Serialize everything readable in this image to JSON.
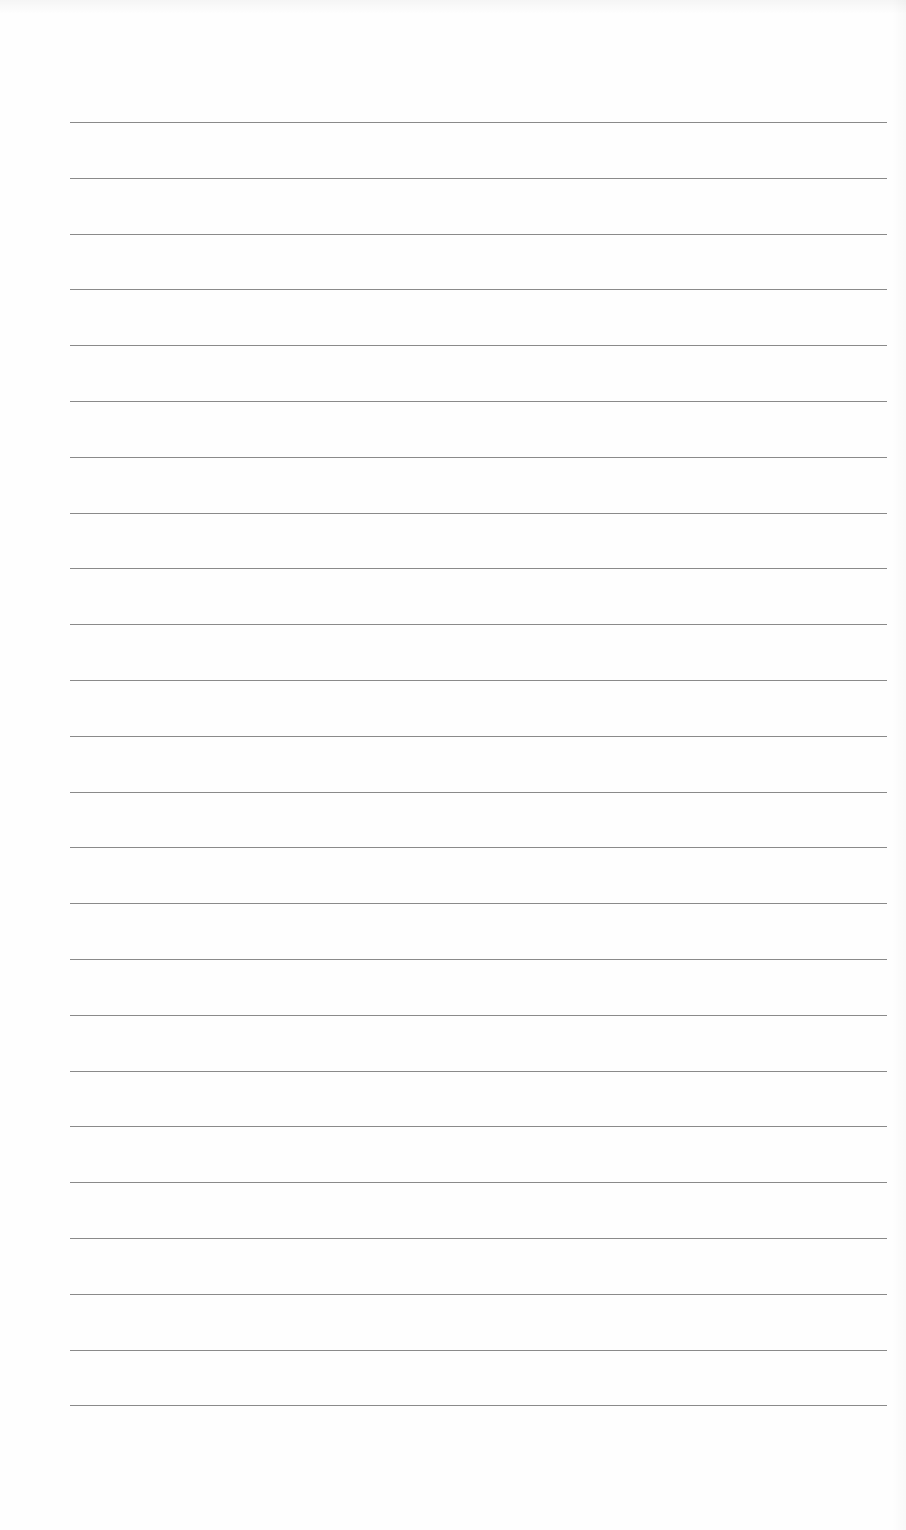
{
  "document": {
    "type": "lined-paper",
    "background_color": "#fefefe",
    "line_color": "#8a8a8a",
    "line_count": 24,
    "line_left": 70,
    "line_right": 887,
    "first_line_y": 122,
    "line_spacing": 55.8,
    "lines": [
      {
        "index": 1,
        "text": ""
      },
      {
        "index": 2,
        "text": ""
      },
      {
        "index": 3,
        "text": ""
      },
      {
        "index": 4,
        "text": ""
      },
      {
        "index": 5,
        "text": ""
      },
      {
        "index": 6,
        "text": ""
      },
      {
        "index": 7,
        "text": ""
      },
      {
        "index": 8,
        "text": ""
      },
      {
        "index": 9,
        "text": ""
      },
      {
        "index": 10,
        "text": ""
      },
      {
        "index": 11,
        "text": ""
      },
      {
        "index": 12,
        "text": ""
      },
      {
        "index": 13,
        "text": ""
      },
      {
        "index": 14,
        "text": ""
      },
      {
        "index": 15,
        "text": ""
      },
      {
        "index": 16,
        "text": ""
      },
      {
        "index": 17,
        "text": ""
      },
      {
        "index": 18,
        "text": ""
      },
      {
        "index": 19,
        "text": ""
      },
      {
        "index": 20,
        "text": ""
      },
      {
        "index": 21,
        "text": ""
      },
      {
        "index": 22,
        "text": ""
      },
      {
        "index": 23,
        "text": ""
      },
      {
        "index": 24,
        "text": ""
      }
    ]
  }
}
